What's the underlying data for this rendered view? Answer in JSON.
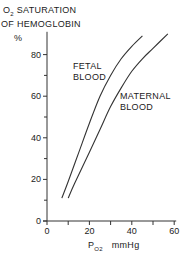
{
  "chart_data": {
    "type": "line",
    "ylabel": "%",
    "xlabel": "PO2 mmHg",
    "xlim": [
      0,
      60
    ],
    "ylim": [
      0,
      90
    ],
    "x_ticks": [
      0,
      20,
      40,
      60
    ],
    "y_ticks": [
      0,
      20,
      40,
      60,
      80
    ],
    "grid": false,
    "legend": "inline annotations",
    "series": [
      {
        "name": "FETAL BLOOD",
        "x": [
          7,
          10,
          15,
          20,
          25,
          30,
          35,
          40,
          45
        ],
        "y": [
          11,
          19,
          33,
          47,
          60,
          70,
          78,
          84,
          89
        ]
      },
      {
        "name": "MATERNAL BLOOD",
        "x": [
          10,
          13,
          20,
          25,
          30,
          35,
          40,
          45,
          50,
          57
        ],
        "y": [
          11,
          18,
          33,
          44,
          55,
          64,
          72,
          78,
          83,
          90
        ]
      }
    ]
  },
  "labels": {
    "title_line1_prefix": "O",
    "title_line1_sub": "2",
    "title_line1_rest": " SATURATION",
    "title_line2": "OF HEMOGLOBIN",
    "y_unit": "%",
    "fetal_line1": "FETAL",
    "fetal_line2": "BLOOD",
    "maternal_line1": "MATERNAL",
    "maternal_line2": "BLOOD",
    "x_label_main": "P",
    "x_label_sub": "O2",
    "x_label_unit": "mmHg"
  }
}
